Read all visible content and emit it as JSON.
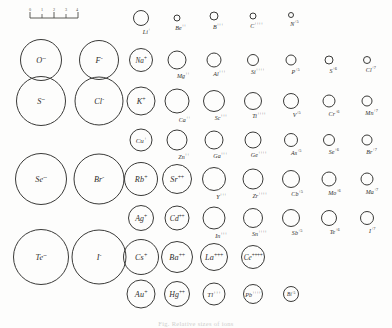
{
  "figure": {
    "caption": "Fig. Relative sizes of ions"
  },
  "scale": {
    "name": "scale-bar",
    "ticks": [
      "0",
      "1",
      "2",
      "3",
      "4"
    ],
    "unit": "A"
  },
  "chart_data": {
    "type": "scatter",
    "title": "Relative sizes of ions",
    "xlabel": "",
    "ylabel": "",
    "note": "Circle diameter is proportional to ionic radius; values in angstroms",
    "ions": [
      {
        "symbol": "Li",
        "charge": "+",
        "label": "Li+",
        "cx": 141,
        "cy": 18,
        "d": 16,
        "inside": false,
        "radius": 0.6
      },
      {
        "symbol": "Be",
        "charge": "++",
        "label": "Be++",
        "cx": 177,
        "cy": 18,
        "d": 7,
        "inside": false,
        "radius": 0.31
      },
      {
        "symbol": "B",
        "charge": "+++",
        "label": "B+++",
        "cx": 214,
        "cy": 16,
        "d": 9,
        "inside": false,
        "radius": 0.2
      },
      {
        "symbol": "C",
        "charge": "++++",
        "label": "C++++",
        "cx": 253,
        "cy": 16,
        "d": 7,
        "inside": false,
        "radius": 0.15
      },
      {
        "symbol": "N",
        "charge": "+5",
        "label": "N+5",
        "cx": 291,
        "cy": 15,
        "d": 6,
        "inside": false,
        "radius": 0.11
      },
      {
        "symbol": "O",
        "charge": "--",
        "label": "O--",
        "cx": 41,
        "cy": 60,
        "d": 42,
        "inside": true,
        "radius": 1.4
      },
      {
        "symbol": "F",
        "charge": "-",
        "label": "F-",
        "cx": 99,
        "cy": 60,
        "d": 40,
        "inside": true,
        "radius": 1.36
      },
      {
        "symbol": "Na",
        "charge": "+",
        "label": "Na+",
        "cx": 141,
        "cy": 60,
        "d": 24,
        "inside": true,
        "radius": 0.95
      },
      {
        "symbol": "Mg",
        "charge": "++",
        "label": "Mg++",
        "cx": 177,
        "cy": 60,
        "d": 19,
        "inside": false,
        "radius": 0.65
      },
      {
        "symbol": "Al",
        "charge": "+++",
        "label": "Al+++",
        "cx": 214,
        "cy": 60,
        "d": 15,
        "inside": false,
        "radius": 0.5
      },
      {
        "symbol": "Si",
        "charge": "++++",
        "label": "Si++++",
        "cx": 253,
        "cy": 60,
        "d": 12,
        "inside": false,
        "radius": 0.41
      },
      {
        "symbol": "P",
        "charge": "+5",
        "label": "P+5",
        "cx": 291,
        "cy": 60,
        "d": 11,
        "inside": false,
        "radius": 0.34
      },
      {
        "symbol": "S",
        "charge": "+6",
        "label": "S+6",
        "cx": 329,
        "cy": 60,
        "d": 9,
        "inside": false,
        "radius": 0.29
      },
      {
        "symbol": "Cl",
        "charge": "+7",
        "label": "Cl+7",
        "cx": 367,
        "cy": 60,
        "d": 8,
        "inside": false,
        "radius": 0.26
      },
      {
        "symbol": "S",
        "charge": "--",
        "label": "S--",
        "cx": 41,
        "cy": 101,
        "d": 50,
        "inside": true,
        "radius": 1.84
      },
      {
        "symbol": "Cl",
        "charge": "-",
        "label": "Cl-",
        "cx": 99,
        "cy": 101,
        "d": 49,
        "inside": true,
        "radius": 1.81
      },
      {
        "symbol": "K",
        "charge": "+",
        "label": "K+",
        "cx": 141,
        "cy": 101,
        "d": 29,
        "inside": true,
        "radius": 1.33
      },
      {
        "symbol": "Ca",
        "charge": "++",
        "label": "Ca++",
        "cx": 177,
        "cy": 101,
        "d": 25,
        "inside": false,
        "radius": 0.99
      },
      {
        "symbol": "Sc",
        "charge": "+++",
        "label": "Sc+++",
        "cx": 214,
        "cy": 101,
        "d": 22,
        "inside": false,
        "radius": 0.81
      },
      {
        "symbol": "Ti",
        "charge": "++++",
        "label": "Ti++++",
        "cx": 253,
        "cy": 101,
        "d": 18,
        "inside": false,
        "radius": 0.68
      },
      {
        "symbol": "V",
        "charge": "+5",
        "label": "V+5",
        "cx": 291,
        "cy": 101,
        "d": 16,
        "inside": false,
        "radius": 0.59
      },
      {
        "symbol": "Cr",
        "charge": "+6",
        "label": "Cr+6",
        "cx": 329,
        "cy": 101,
        "d": 13,
        "inside": false,
        "radius": 0.52
      },
      {
        "symbol": "Mn",
        "charge": "+7",
        "label": "Mn+7",
        "cx": 367,
        "cy": 101,
        "d": 11,
        "inside": false,
        "radius": 0.46
      },
      {
        "symbol": "Cu",
        "charge": "+",
        "label": "Cu+",
        "cx": 141,
        "cy": 140,
        "d": 23,
        "inside": true,
        "radius": 0.96
      },
      {
        "symbol": "Zn",
        "charge": "++",
        "label": "Zn++",
        "cx": 177,
        "cy": 140,
        "d": 21,
        "inside": false,
        "radius": 0.74
      },
      {
        "symbol": "Ga",
        "charge": "+++",
        "label": "Ga+++",
        "cx": 214,
        "cy": 140,
        "d": 19,
        "inside": false,
        "radius": 0.62
      },
      {
        "symbol": "Ge",
        "charge": "++++",
        "label": "Ge++++",
        "cx": 253,
        "cy": 140,
        "d": 17,
        "inside": false,
        "radius": 0.53
      },
      {
        "symbol": "As",
        "charge": "+5",
        "label": "As+5",
        "cx": 291,
        "cy": 140,
        "d": 14,
        "inside": false,
        "radius": 0.47
      },
      {
        "symbol": "Se",
        "charge": "+6",
        "label": "Se+6",
        "cx": 329,
        "cy": 140,
        "d": 12,
        "inside": false,
        "radius": 0.42
      },
      {
        "symbol": "Br",
        "charge": "+7",
        "label": "Br+7",
        "cx": 367,
        "cy": 140,
        "d": 11,
        "inside": false,
        "radius": 0.39
      },
      {
        "symbol": "Se",
        "charge": "--",
        "label": "Se--",
        "cx": 41,
        "cy": 179,
        "d": 52,
        "inside": true,
        "radius": 1.98
      },
      {
        "symbol": "Br",
        "charge": "-",
        "label": "Br-",
        "cx": 99,
        "cy": 179,
        "d": 51,
        "inside": true,
        "radius": 1.95
      },
      {
        "symbol": "Rb",
        "charge": "+",
        "label": "Rb+",
        "cx": 141,
        "cy": 179,
        "d": 34,
        "inside": true,
        "radius": 1.48
      },
      {
        "symbol": "Sr",
        "charge": "++",
        "label": "Sr++",
        "cx": 177,
        "cy": 179,
        "d": 30,
        "inside": true,
        "radius": 1.13
      },
      {
        "symbol": "Y",
        "charge": "+++",
        "label": "Y+++",
        "cx": 214,
        "cy": 179,
        "d": 24,
        "inside": false,
        "radius": 0.93
      },
      {
        "symbol": "Zr",
        "charge": "++++",
        "label": "Zr++++",
        "cx": 253,
        "cy": 179,
        "d": 21,
        "inside": false,
        "radius": 0.8
      },
      {
        "symbol": "Cb",
        "charge": "+5",
        "label": "Cb+5",
        "cx": 291,
        "cy": 179,
        "d": 18,
        "inside": false,
        "radius": 0.7
      },
      {
        "symbol": "Mo",
        "charge": "+6",
        "label": "Mo+6",
        "cx": 329,
        "cy": 179,
        "d": 15,
        "inside": false,
        "radius": 0.62
      },
      {
        "symbol": "Ma",
        "charge": "+7",
        "label": "Ma+7",
        "cx": 367,
        "cy": 179,
        "d": 13,
        "inside": false,
        "radius": 0.56
      },
      {
        "symbol": "Ag",
        "charge": "+",
        "label": "Ag+",
        "cx": 141,
        "cy": 218,
        "d": 26,
        "inside": true,
        "radius": 1.26
      },
      {
        "symbol": "Cd",
        "charge": "++",
        "label": "Cd++",
        "cx": 177,
        "cy": 218,
        "d": 25,
        "inside": true,
        "radius": 0.97
      },
      {
        "symbol": "In",
        "charge": "+++",
        "label": "In+++",
        "cx": 214,
        "cy": 218,
        "d": 23,
        "inside": false,
        "radius": 0.81
      },
      {
        "symbol": "Sn",
        "charge": "++++",
        "label": "Sn++++",
        "cx": 253,
        "cy": 218,
        "d": 20,
        "inside": false,
        "radius": 0.71
      },
      {
        "symbol": "Sb",
        "charge": "+5",
        "label": "Sb+5",
        "cx": 291,
        "cy": 218,
        "d": 18,
        "inside": false,
        "radius": 0.62
      },
      {
        "symbol": "Te",
        "charge": "+6",
        "label": "Te+6",
        "cx": 329,
        "cy": 218,
        "d": 16,
        "inside": false,
        "radius": 0.56
      },
      {
        "symbol": "I",
        "charge": "+7",
        "label": "I+7",
        "cx": 367,
        "cy": 218,
        "d": 14,
        "inside": false,
        "radius": 0.5
      },
      {
        "symbol": "Te",
        "charge": "--",
        "label": "Te--",
        "cx": 41,
        "cy": 257,
        "d": 56,
        "inside": true,
        "radius": 2.21
      },
      {
        "symbol": "I",
        "charge": "-",
        "label": "I-",
        "cx": 99,
        "cy": 257,
        "d": 55,
        "inside": true,
        "radius": 2.16
      },
      {
        "symbol": "Cs",
        "charge": "+",
        "label": "Cs+",
        "cx": 141,
        "cy": 257,
        "d": 36,
        "inside": true,
        "radius": 1.69
      },
      {
        "symbol": "Ba",
        "charge": "++",
        "label": "Ba++",
        "cx": 177,
        "cy": 257,
        "d": 32,
        "inside": true,
        "radius": 1.35
      },
      {
        "symbol": "La",
        "charge": "+++",
        "label": "La+++",
        "cx": 214,
        "cy": 257,
        "d": 28,
        "inside": true,
        "radius": 1.15
      },
      {
        "symbol": "Ce",
        "charge": "++++",
        "label": "Ce++++",
        "cx": 253,
        "cy": 257,
        "d": 24,
        "inside": true,
        "radius": 1.01
      },
      {
        "symbol": "Au",
        "charge": "+",
        "label": "Au+",
        "cx": 141,
        "cy": 294,
        "d": 29,
        "inside": true,
        "radius": 1.37
      },
      {
        "symbol": "Hg",
        "charge": "++",
        "label": "Hg++",
        "cx": 177,
        "cy": 294,
        "d": 26,
        "inside": true,
        "radius": 1.1
      },
      {
        "symbol": "Tl",
        "charge": "+++",
        "label": "Tl+++",
        "cx": 214,
        "cy": 294,
        "d": 23,
        "inside": true,
        "radius": 0.95
      },
      {
        "symbol": "Pb",
        "charge": "++++",
        "label": "Pb++++",
        "cx": 253,
        "cy": 294,
        "d": 20,
        "inside": true,
        "radius": 0.84
      },
      {
        "symbol": "Bi",
        "charge": "+5",
        "label": "Bi+5",
        "cx": 291,
        "cy": 294,
        "d": 16,
        "inside": true,
        "radius": 0.74
      }
    ]
  }
}
